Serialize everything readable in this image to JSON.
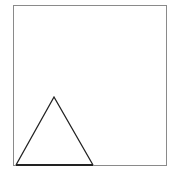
{
  "canvas": {
    "width": 169,
    "height": 175,
    "background": "#ffffff"
  },
  "frame": {
    "x": 13,
    "y": 5,
    "width": 153,
    "height": 160,
    "stroke": "#8a8a8a",
    "stroke_width": 1
  },
  "triangle": {
    "points": [
      [
        16,
        165
      ],
      [
        54,
        97
      ],
      [
        93,
        165
      ]
    ],
    "stroke": "#222222",
    "stroke_width": 1.3,
    "fill": "none",
    "base_stroke_width": 2
  }
}
